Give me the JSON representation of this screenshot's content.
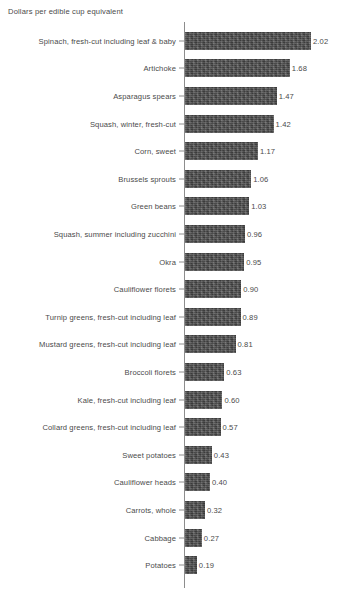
{
  "chart_data": {
    "type": "bar",
    "orientation": "horizontal",
    "title": "Dollars per edible cup equivalent",
    "xlabel": "",
    "ylabel": "",
    "grid": false,
    "legend": null,
    "xlim": [
      0,
      2.02
    ],
    "categories": [
      "Spinach, fresh-cut including leaf & baby",
      "Artichoke",
      "Asparagus spears",
      "Squash, winter, fresh-cut",
      "Corn, sweet",
      "Brussels sprouts",
      "Green beans",
      "Squash, summer including zucchini",
      "Okra",
      "Cauliflower florets",
      "Turnip greens, fresh-cut including leaf",
      "Mustard greens, fresh-cut including leaf",
      "Broccoli florets",
      "Kale, fresh-cut including leaf",
      "Collard greens, fresh-cut including leaf",
      "Sweet potatoes",
      "Cauliflower heads",
      "Carrots, whole",
      "Cabbage",
      "Potatoes"
    ],
    "values": [
      2.02,
      1.68,
      1.47,
      1.42,
      1.17,
      1.06,
      1.03,
      0.96,
      0.95,
      0.9,
      0.89,
      0.81,
      0.63,
      0.6,
      0.57,
      0.43,
      0.4,
      0.32,
      0.27,
      0.19
    ],
    "value_labels": [
      "2.02",
      "1.68",
      "1.47",
      "1.42",
      "1.17",
      "1.06",
      "1.03",
      "0.96",
      "0.95",
      "0.90",
      "0.89",
      "0.81",
      "0.63",
      "0.60",
      "0.57",
      "0.43",
      "0.40",
      "0.32",
      "0.27",
      "0.19"
    ],
    "bar_color": "#4e4e4e",
    "axis_color": "#8d8d8d",
    "text_color": "#4a4a4a",
    "background_color": "#ffffff"
  }
}
